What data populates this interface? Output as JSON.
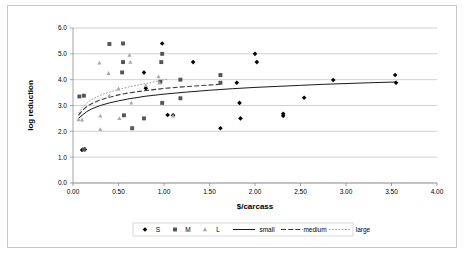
{
  "chart_data": {
    "type": "scatter",
    "title": "",
    "xlabel": "$/carcass",
    "ylabel": "log reduction",
    "xlim": [
      0.0,
      4.0
    ],
    "ylim": [
      0.0,
      6.0
    ],
    "xticks": [
      "0.00",
      "0.50",
      "1.00",
      "1.50",
      "2.00",
      "2.50",
      "3.00",
      "3.50",
      "4.00"
    ],
    "yticks": [
      "0.0",
      "1.0",
      "2.0",
      "3.0",
      "4.0",
      "5.0",
      "6.0"
    ],
    "grid": "horizontal",
    "legend_position": "bottom",
    "legend": [
      {
        "label": "S",
        "kind": "marker",
        "marker": "diamond",
        "color": "#000000"
      },
      {
        "label": "M",
        "kind": "marker",
        "marker": "square",
        "color": "#555555"
      },
      {
        "label": "L",
        "kind": "marker",
        "marker": "triangle",
        "color": "#aaaaaa"
      },
      {
        "label": "small",
        "kind": "line",
        "style": "solid",
        "color": "#1a1a1a"
      },
      {
        "label": "medium",
        "kind": "line",
        "style": "dashed",
        "color": "#3a3a3a"
      },
      {
        "label": "large",
        "kind": "line",
        "style": "dotted",
        "color": "#9a9a9a"
      }
    ],
    "series": [
      {
        "name": "S",
        "marker": "diamond",
        "color": "#000000",
        "points": [
          [
            0.1,
            1.28
          ],
          [
            0.13,
            1.3
          ],
          [
            0.78,
            4.28
          ],
          [
            0.8,
            3.67
          ],
          [
            0.98,
            5.4
          ],
          [
            1.04,
            2.63
          ],
          [
            1.1,
            2.62
          ],
          [
            1.32,
            4.68
          ],
          [
            1.62,
            2.12
          ],
          [
            1.8,
            3.88
          ],
          [
            1.83,
            3.1
          ],
          [
            1.84,
            2.5
          ],
          [
            2.0,
            5.0
          ],
          [
            2.02,
            4.68
          ],
          [
            2.31,
            2.68
          ],
          [
            2.31,
            2.6
          ],
          [
            2.54,
            3.3
          ],
          [
            2.86,
            3.99
          ],
          [
            3.54,
            4.18
          ],
          [
            3.55,
            3.88
          ]
        ]
      },
      {
        "name": "M",
        "marker": "square",
        "color": "#555555",
        "points": [
          [
            0.07,
            3.35
          ],
          [
            0.12,
            3.38
          ],
          [
            0.12,
            1.3
          ],
          [
            0.4,
            5.38
          ],
          [
            0.54,
            4.28
          ],
          [
            0.55,
            4.68
          ],
          [
            0.55,
            5.4
          ],
          [
            0.56,
            2.62
          ],
          [
            0.65,
            2.12
          ],
          [
            0.78,
            2.5
          ],
          [
            0.96,
            3.92
          ],
          [
            0.97,
            4.68
          ],
          [
            0.98,
            5.0
          ],
          [
            0.98,
            3.1
          ],
          [
            1.18,
            4.0
          ],
          [
            1.18,
            3.28
          ],
          [
            1.62,
            4.18
          ],
          [
            1.62,
            3.88
          ]
        ]
      },
      {
        "name": "L",
        "marker": "triangle",
        "color": "#aaaaaa",
        "points": [
          [
            0.06,
            2.46
          ],
          [
            0.1,
            2.45
          ],
          [
            0.29,
            4.65
          ],
          [
            0.3,
            2.6
          ],
          [
            0.3,
            2.08
          ],
          [
            0.39,
            4.25
          ],
          [
            0.4,
            3.38
          ],
          [
            0.5,
            3.65
          ],
          [
            0.51,
            2.5
          ],
          [
            0.62,
            4.95
          ],
          [
            0.63,
            4.68
          ],
          [
            0.64,
            3.1
          ],
          [
            0.8,
            3.78
          ],
          [
            0.94,
            4.12
          ],
          [
            0.95,
            3.88
          ],
          [
            1.1,
            2.6
          ]
        ]
      }
    ],
    "curves": [
      {
        "name": "small",
        "style": "solid",
        "color": "#1a1a1a",
        "points": [
          [
            0.06,
            2.5
          ],
          [
            0.1,
            2.62
          ],
          [
            0.15,
            2.76
          ],
          [
            0.2,
            2.86
          ],
          [
            0.3,
            3.0
          ],
          [
            0.4,
            3.1
          ],
          [
            0.5,
            3.18
          ],
          [
            0.6,
            3.25
          ],
          [
            0.8,
            3.36
          ],
          [
            1.0,
            3.44
          ],
          [
            1.25,
            3.52
          ],
          [
            1.5,
            3.59
          ],
          [
            1.75,
            3.65
          ],
          [
            2.0,
            3.7
          ],
          [
            2.25,
            3.74
          ],
          [
            2.5,
            3.78
          ],
          [
            2.75,
            3.82
          ],
          [
            3.0,
            3.85
          ],
          [
            3.25,
            3.88
          ],
          [
            3.55,
            3.91
          ]
        ]
      },
      {
        "name": "medium",
        "style": "dashed",
        "color": "#3a3a3a",
        "points": [
          [
            0.06,
            2.62
          ],
          [
            0.1,
            2.8
          ],
          [
            0.15,
            2.96
          ],
          [
            0.2,
            3.06
          ],
          [
            0.3,
            3.22
          ],
          [
            0.4,
            3.32
          ],
          [
            0.5,
            3.41
          ],
          [
            0.6,
            3.48
          ],
          [
            0.8,
            3.58
          ],
          [
            1.0,
            3.66
          ],
          [
            1.2,
            3.72
          ],
          [
            1.4,
            3.77
          ],
          [
            1.62,
            3.82
          ]
        ]
      },
      {
        "name": "large",
        "style": "dotted",
        "color": "#9a9a9a",
        "points": [
          [
            0.06,
            2.7
          ],
          [
            0.1,
            2.92
          ],
          [
            0.15,
            3.1
          ],
          [
            0.2,
            3.22
          ],
          [
            0.3,
            3.4
          ],
          [
            0.4,
            3.52
          ],
          [
            0.5,
            3.62
          ],
          [
            0.6,
            3.71
          ],
          [
            0.7,
            3.78
          ],
          [
            0.8,
            3.85
          ],
          [
            0.9,
            3.92
          ],
          [
            1.0,
            4.0
          ],
          [
            1.05,
            4.03
          ]
        ]
      }
    ]
  }
}
